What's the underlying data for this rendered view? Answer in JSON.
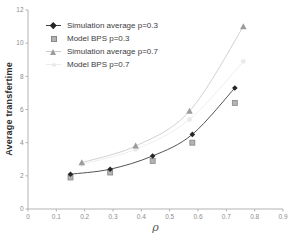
{
  "chart_data": {
    "type": "line",
    "title": "",
    "xlabel": "ρ",
    "ylabel": "Average transfertime",
    "xlim": [
      0,
      0.9
    ],
    "ylim": [
      0,
      12
    ],
    "x_ticks": [
      0,
      0.1,
      0.2,
      0.3,
      0.4,
      0.5,
      0.6,
      0.7,
      0.8,
      0.9
    ],
    "y_ticks": [
      0,
      2,
      4,
      6,
      8,
      10,
      12
    ],
    "grid": false,
    "legend_position": "top-left-inside",
    "axis_color": "#b3b3b3",
    "tick_label_color": "#8c8c8c",
    "series": [
      {
        "name": "Simulation average p=0.3",
        "marker": "diamond",
        "marker_color": "#262626",
        "line": true,
        "line_color": "#404040",
        "x": [
          0.15,
          0.29,
          0.44,
          0.58,
          0.73
        ],
        "y": [
          2.1,
          2.4,
          3.2,
          4.5,
          7.3
        ]
      },
      {
        "name": "Model BPS p=0.3",
        "marker": "square",
        "marker_color": "#b3b3b3",
        "marker_border_color": "#878787",
        "line": false,
        "x": [
          0.15,
          0.29,
          0.44,
          0.58,
          0.73
        ],
        "y": [
          1.9,
          2.2,
          2.9,
          4.0,
          6.4
        ]
      },
      {
        "name": "Simulation average p=0.7",
        "marker": "triangle",
        "marker_color": "#9c9c9c",
        "line": true,
        "line_color": "#cbcbcb",
        "x": [
          0.19,
          0.38,
          0.57,
          0.76
        ],
        "y": [
          2.8,
          3.8,
          5.9,
          11.0
        ]
      },
      {
        "name": "Model BPS p=0.7",
        "marker": "dot",
        "marker_color": "#ebeae6",
        "line": true,
        "line_color": "#edece8",
        "x": [
          0.19,
          0.38,
          0.57,
          0.76
        ],
        "y": [
          2.7,
          3.6,
          5.4,
          8.9
        ]
      }
    ]
  }
}
